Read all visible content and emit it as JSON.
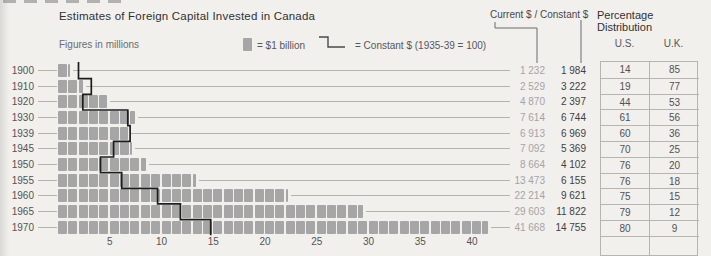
{
  "header": {
    "title": "Estimates of Foreign Capital Invested in Canada",
    "subtitle": "Figures in millions",
    "columns_header": "Current $ / Constant $",
    "table_header": "Percentage Distribution",
    "us_label": "U.S.",
    "uk_label": "U.K."
  },
  "legend": {
    "square_label": "= $1 billion",
    "line_label": "= Constant $ (1935-39 = 100)"
  },
  "rows": [
    {
      "year": "1900",
      "current": "1 232",
      "constant": "1 984",
      "us": "14",
      "uk": "85"
    },
    {
      "year": "1910",
      "current": "2 529",
      "constant": "3 222",
      "us": "19",
      "uk": "77"
    },
    {
      "year": "1920",
      "current": "4 870",
      "constant": "2 397",
      "us": "44",
      "uk": "53"
    },
    {
      "year": "1930",
      "current": "7 614",
      "constant": "6 744",
      "us": "61",
      "uk": "56"
    },
    {
      "year": "1939",
      "current": "6 913",
      "constant": "6 969",
      "us": "60",
      "uk": "36"
    },
    {
      "year": "1945",
      "current": "7 092",
      "constant": "5 369",
      "us": "70",
      "uk": "25"
    },
    {
      "year": "1950",
      "current": "8 664",
      "constant": "4 102",
      "us": "76",
      "uk": "20"
    },
    {
      "year": "1955",
      "current": "13 473",
      "constant": "6 155",
      "us": "76",
      "uk": "18"
    },
    {
      "year": "1960",
      "current": "22 214",
      "constant": "9 621",
      "us": "75",
      "uk": "15"
    },
    {
      "year": "1965",
      "current": "29 603",
      "constant": "11 822",
      "us": "79",
      "uk": "12"
    },
    {
      "year": "1970",
      "current": "41 668",
      "constant": "14 755",
      "us": "80",
      "uk": "9"
    }
  ],
  "chart_data": {
    "type": "bar",
    "title": "Estimates of Foreign Capital Invested in Canada",
    "note": "Figures in millions; one square = $1 billion",
    "categories": [
      "1900",
      "1910",
      "1920",
      "1930",
      "1939",
      "1945",
      "1950",
      "1955",
      "1960",
      "1965",
      "1970"
    ],
    "series": [
      {
        "name": "Current $",
        "values": [
          1232,
          2529,
          4870,
          7614,
          6913,
          7092,
          8664,
          13473,
          22214,
          29603,
          41668
        ]
      },
      {
        "name": "Constant $ (1935-39 = 100)",
        "values": [
          1984,
          3222,
          2397,
          6744,
          6969,
          5369,
          4102,
          6155,
          9621,
          11822,
          14755
        ]
      }
    ],
    "percentage_distribution": {
      "US": [
        14,
        19,
        44,
        61,
        60,
        70,
        76,
        76,
        75,
        79,
        80
      ],
      "UK": [
        85,
        77,
        53,
        56,
        36,
        25,
        20,
        18,
        15,
        12,
        9
      ]
    },
    "xticks": [
      5,
      10,
      15,
      20,
      25,
      30,
      35,
      40
    ],
    "xlabel": "",
    "ylabel": "",
    "xlim": [
      0,
      42
    ],
    "grid": "horizontal leader lines per row",
    "legend_position": "top"
  },
  "colors": {
    "background": "#f1f0ed",
    "bar_square": "#a6a6a6",
    "constant_line": "#1d1d1d",
    "current_value_text": "#a4a4a6",
    "constant_value_text": "#3f3f41",
    "table_border": "#b6b5b2",
    "leader_line": "#b4b3b0"
  }
}
